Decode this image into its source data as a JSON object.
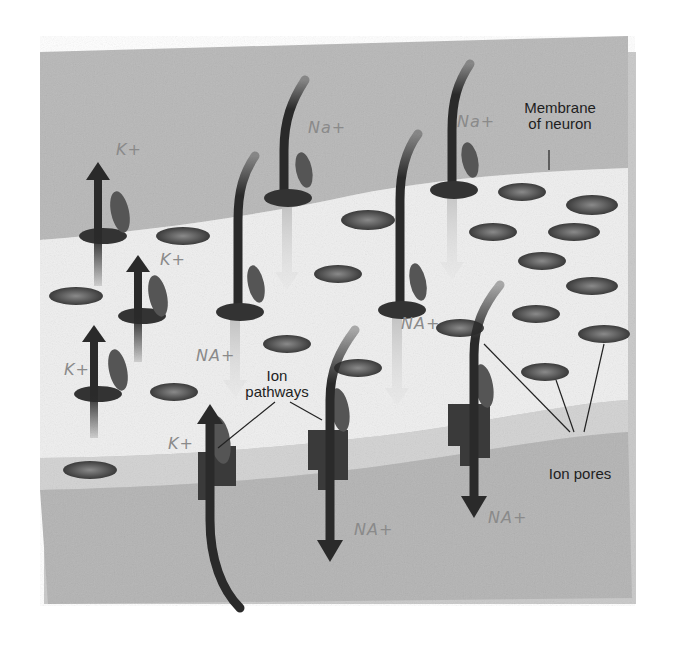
{
  "diagram": {
    "labels": {
      "membrane": [
        "Membrane",
        "of neuron"
      ],
      "ion_pathways": [
        "Ion",
        "pathways"
      ],
      "ion_pores": "Ion pores"
    },
    "handwritten": {
      "k1": "K+",
      "k2": "K+",
      "k3": "K+",
      "k4": "K+",
      "na1": "Na+",
      "na2": "Na+",
      "na3": "NA+",
      "na4": "NA+",
      "na5": "NA+",
      "na6": "NA+"
    },
    "colors": {
      "background": "#ffffff",
      "outer_band": "#b4b4b4",
      "membrane_surface": "#ededed",
      "membrane_edge": "#cfcfcf",
      "arrow": "#2a2a2a",
      "pore": "#4a4a4a",
      "handwriting": "#8a8a8a"
    }
  }
}
